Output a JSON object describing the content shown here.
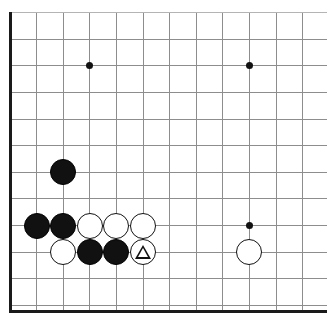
{
  "board": {
    "kind": "go-board-diagram",
    "title": "Go board corner position",
    "size_px": {
      "width": 327,
      "height": 323
    },
    "grid": {
      "origin_x": 10,
      "origin_y": 12.7,
      "spacing": 26.6,
      "columns_visible": 12,
      "rows_visible": 12,
      "line_color": "#8d8d8d",
      "edge_color": "#1a1a1a",
      "background_color": "#ffffff",
      "cropped_edges": [
        "right"
      ]
    },
    "star_points": [
      {
        "name": "hoshi-upper-left",
        "col": 3,
        "row": 2
      },
      {
        "name": "hoshi-upper-right",
        "col": 9,
        "row": 2
      },
      {
        "name": "hoshi-lower-right",
        "col": 9,
        "row": 8
      }
    ],
    "stones": [
      {
        "id": "stone-black-c3-r6",
        "color": "black",
        "col": 2,
        "row": 6,
        "marker": "none"
      },
      {
        "id": "stone-black-c1-r8",
        "color": "black",
        "col": 1,
        "row": 8,
        "marker": "none"
      },
      {
        "id": "stone-black-c2-r8",
        "color": "black",
        "col": 2,
        "row": 8,
        "marker": "none"
      },
      {
        "id": "stone-white-c3-r8",
        "color": "white",
        "col": 3,
        "row": 8,
        "marker": "none"
      },
      {
        "id": "stone-white-c4-r8",
        "color": "white",
        "col": 4,
        "row": 8,
        "marker": "none"
      },
      {
        "id": "stone-white-c5-r8",
        "color": "white",
        "col": 5,
        "row": 8,
        "marker": "none"
      },
      {
        "id": "stone-white-c2-r9",
        "color": "white",
        "col": 2,
        "row": 9,
        "marker": "none"
      },
      {
        "id": "stone-black-c3-r9",
        "color": "black",
        "col": 3,
        "row": 9,
        "marker": "none"
      },
      {
        "id": "stone-black-c4-r9",
        "color": "black",
        "col": 4,
        "row": 9,
        "marker": "none"
      },
      {
        "id": "stone-white-c5-r9",
        "color": "white",
        "col": 5,
        "row": 9,
        "marker": "triangle"
      },
      {
        "id": "stone-white-c9-r9",
        "color": "white",
        "col": 9,
        "row": 9,
        "marker": "none"
      }
    ],
    "markers": [
      {
        "id": "triangle-marker-c5-r9",
        "shape": "triangle",
        "col": 5,
        "row": 9,
        "color": "#111111"
      }
    ]
  }
}
